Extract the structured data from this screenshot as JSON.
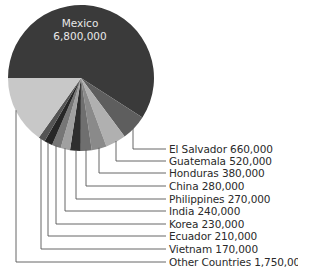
{
  "chart_data": {
    "type": "pie",
    "title": "",
    "categories": [
      "Mexico",
      "El Salvador",
      "Guatemala",
      "Honduras",
      "China",
      "Philippines",
      "India",
      "Korea",
      "Ecuador",
      "Vietnam",
      "Other Countries"
    ],
    "values": [
      6800000,
      660000,
      520000,
      380000,
      280000,
      270000,
      240000,
      230000,
      210000,
      170000,
      1750000
    ],
    "slices": [
      {
        "name": "Mexico",
        "value": 6800000,
        "display": "6,800,000",
        "color": "#3a3a3a"
      },
      {
        "name": "El Salvador",
        "value": 660000,
        "display": "660,000",
        "color": "#5e5e5e"
      },
      {
        "name": "Guatemala",
        "value": 520000,
        "display": "520,000",
        "color": "#b0b0b0"
      },
      {
        "name": "Honduras",
        "value": 380000,
        "display": "380,000",
        "color": "#8a8a8a"
      },
      {
        "name": "China",
        "value": 280000,
        "display": "280,000",
        "color": "#6f6f6f"
      },
      {
        "name": "Philippines",
        "value": 270000,
        "display": "270,000",
        "color": "#2e2e2e"
      },
      {
        "name": "India",
        "value": 240000,
        "display": "240,000",
        "color": "#a0a0a0"
      },
      {
        "name": "Korea",
        "value": 230000,
        "display": "230,000",
        "color": "#767676"
      },
      {
        "name": "Ecuador",
        "value": 210000,
        "display": "210,000",
        "color": "#262626"
      },
      {
        "name": "Vietnam",
        "value": 170000,
        "display": "170,000",
        "color": "#545454"
      },
      {
        "name": "Other Countries",
        "value": 1750000,
        "display": "1,750,000",
        "color": "#c8c8c8"
      }
    ],
    "labels": {
      "center": {
        "name": "Mexico",
        "value": "6,800,000"
      },
      "outside": [
        "El Salvador 660,000",
        "Guatemala 520,000",
        "Honduras 380,000",
        "China 280,000",
        "Philippines 270,000",
        "India 240,000",
        "Korea 230,000",
        "Ecuador 210,000",
        "Vietnam 170,000",
        "Other Countries 1,750,000"
      ]
    },
    "legend": "none (leader-line labels)",
    "start_angle": "9 o'clock, clockwise"
  },
  "style": {
    "leader_color": "#555555",
    "text_color": "#2a2a2a"
  }
}
